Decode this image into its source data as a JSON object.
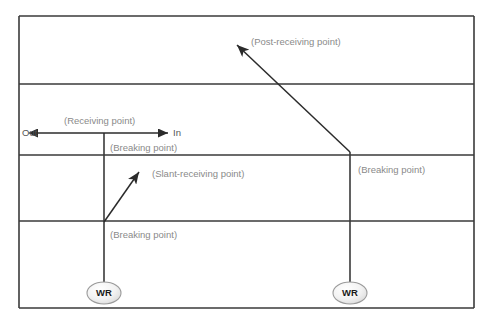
{
  "diagram": {
    "background_color": "#ffffff",
    "line_color": "#3a3a3a",
    "label_color": "#8a8a8a",
    "direction_label_color": "#555555",
    "node_fill_color": "#efefef",
    "node_stroke_color": "#9a9a9a",
    "frame": {
      "name": "outer-frame",
      "x": 19,
      "y": 16,
      "width": 455,
      "height": 292
    },
    "horizontal_lines": [
      {
        "name": "frame-top-edge",
        "y": 16
      },
      {
        "name": "divider-1",
        "y": 84
      },
      {
        "name": "divider-2",
        "y": 155
      },
      {
        "name": "divider-3",
        "y": 221
      },
      {
        "name": "frame-bottom-edge",
        "y": 308
      }
    ],
    "vertical_lines": [
      {
        "name": "left-vertical-line",
        "x": 104,
        "y_start": 133,
        "y_end": 284
      },
      {
        "name": "right-vertical-line",
        "x": 350,
        "y_start": 152,
        "y_end": 284
      }
    ],
    "arrows": {
      "horizontal_double": {
        "name": "in-out-double-arrow",
        "x_start": 38,
        "x_end": 168,
        "y": 133
      },
      "slant": {
        "name": "slant-receiving-arrow",
        "x_start": 104,
        "y_start": 222,
        "x_end": 141,
        "y_end": 170
      },
      "post_receiving": {
        "name": "post-receiving-arrow",
        "x_start": 350,
        "y_start": 152,
        "x_end": 234,
        "y_end": 42
      }
    },
    "labels": {
      "out": "Out",
      "in": "In",
      "receiving_point": "(Receiving point)",
      "breaking_point_upper": "(Breaking point)",
      "slant_receiving_point": "(Slant-receiving point)",
      "breaking_point_lower_left": "(Breaking point)",
      "breaking_point_right": "(Breaking point)",
      "post_receiving_point": "(Post-receiving point)"
    },
    "nodes": [
      {
        "name": "node-wr-left",
        "label": "WR",
        "cx": 104,
        "cy": 293,
        "rx": 17,
        "ry": 11
      },
      {
        "name": "node-wr-right",
        "label": "WR",
        "cx": 350,
        "cy": 293,
        "rx": 17,
        "ry": 11
      }
    ]
  }
}
